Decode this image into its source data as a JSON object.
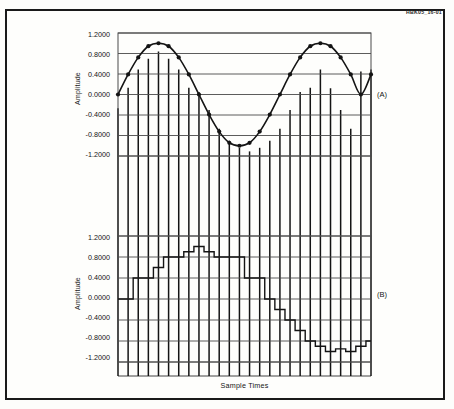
{
  "figure": {
    "id_label": "HBK05_16-01",
    "outer_border_color": "#1a1a1a",
    "background_color": "#fefefc",
    "ink_color": "#141414"
  },
  "axes": {
    "x_title": "Sample Times",
    "y_title": "Amplitude",
    "y_ticks": [
      "1.2000",
      "0.8000",
      "0.4000",
      "0.0000",
      "-0.4000",
      "-0.8000",
      "-1.2000"
    ],
    "y_tick_values": [
      1.2,
      0.8,
      0.4,
      0.0,
      -0.4,
      -0.8,
      -1.2
    ],
    "ylim": [
      -1.4,
      1.4
    ],
    "grid": true
  },
  "panels": [
    {
      "letter": "(A)",
      "name": "sampled-sine-panel"
    },
    {
      "letter": "(B)",
      "name": "quantized-staircase-panel"
    }
  ],
  "chart_data": [
    {
      "type": "line",
      "name": "panel-a-sampled-sine",
      "title": "(A)",
      "xlabel": "Sample Times",
      "ylabel": "Amplitude",
      "ylim": [
        -1.4,
        1.4
      ],
      "grid": true,
      "legend": "none",
      "series": [
        {
          "name": "continuous-sine",
          "style": "smooth-line-with-markers",
          "x": [
            0,
            1,
            2,
            3,
            4,
            5,
            6,
            7,
            8,
            9,
            10,
            11,
            12,
            13,
            14,
            15,
            16,
            17,
            18,
            19,
            20,
            21,
            22,
            23,
            24,
            25
          ],
          "values": [
            0.0,
            0.391,
            0.724,
            0.942,
            1.0,
            0.942,
            0.724,
            0.391,
            0.0,
            -0.391,
            -0.724,
            -0.942,
            -1.0,
            -0.942,
            -0.724,
            -0.391,
            0.0,
            0.391,
            0.724,
            0.942,
            1.0,
            0.942,
            0.724,
            0.391,
            0.0,
            0.391
          ]
        },
        {
          "name": "sample-stems",
          "style": "vertical-stems",
          "x": [
            0,
            1,
            2,
            3,
            4,
            5,
            6,
            7,
            8,
            9,
            10,
            11,
            12,
            13,
            14,
            15,
            16,
            17,
            18,
            19,
            20,
            21,
            22,
            23,
            24,
            25
          ],
          "values": [
            -0.27,
            0.13,
            0.49,
            0.7,
            0.84,
            0.7,
            0.49,
            0.13,
            0.05,
            -0.3,
            -0.67,
            -0.9,
            -1.04,
            -1.11,
            -1.04,
            -0.9,
            -0.67,
            -0.3,
            0.05,
            0.13,
            0.49,
            0.12,
            -0.3,
            -0.67,
            0.45,
            0.49
          ]
        }
      ]
    },
    {
      "type": "line",
      "name": "panel-b-quantized-staircase",
      "title": "(B)",
      "xlabel": "Sample Times",
      "ylabel": "Amplitude",
      "ylim": [
        -1.4,
        1.4
      ],
      "grid": true,
      "legend": "none",
      "series": [
        {
          "name": "sample-and-hold-quantized",
          "style": "staircase",
          "x": [
            0,
            1,
            2,
            3,
            4,
            5,
            6,
            7,
            8,
            9,
            10,
            11,
            12,
            13,
            14,
            15,
            16,
            17,
            18,
            19,
            20,
            21,
            22,
            23,
            24,
            25
          ],
          "values": [
            0.0,
            0.0,
            0.4,
            0.4,
            0.6,
            0.8,
            0.8,
            0.9,
            1.0,
            0.9,
            0.8,
            0.8,
            0.8,
            0.4,
            0.4,
            0.0,
            -0.2,
            -0.4,
            -0.6,
            -0.8,
            -0.9,
            -1.0,
            -0.95,
            -1.0,
            -0.9,
            -0.8
          ]
        }
      ]
    }
  ]
}
